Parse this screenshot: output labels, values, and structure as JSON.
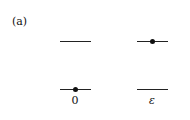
{
  "figure": {
    "panel_label": "(a)",
    "columns": [
      {
        "label": "0",
        "levels": [
          {
            "position": "upper",
            "occupied": false
          },
          {
            "position": "lower",
            "occupied": true
          }
        ]
      },
      {
        "label": "ε",
        "levels": [
          {
            "position": "upper",
            "occupied": true
          },
          {
            "position": "lower",
            "occupied": false
          }
        ]
      }
    ],
    "colors": {
      "line": "#222222",
      "dot": "#111111",
      "background": "#ffffff"
    }
  }
}
